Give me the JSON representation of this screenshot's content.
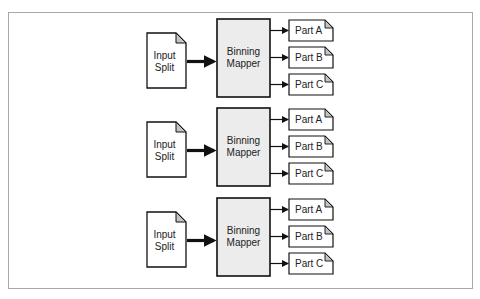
{
  "diagram": {
    "title": "",
    "groups": [
      {
        "input": {
          "line1": "Input",
          "line2": "Split"
        },
        "mapper": {
          "line1": "Binning",
          "line2": "Mapper"
        },
        "parts": [
          "Part A",
          "Part B",
          "Part C"
        ]
      },
      {
        "input": {
          "line1": "Input",
          "line2": "Split"
        },
        "mapper": {
          "line1": "Binning",
          "line2": "Mapper"
        },
        "parts": [
          "Part A",
          "Part B",
          "Part C"
        ]
      },
      {
        "input": {
          "line1": "Input",
          "line2": "Split"
        },
        "mapper": {
          "line1": "Binning",
          "line2": "Mapper"
        },
        "parts": [
          "Part A",
          "Part B",
          "Part C"
        ]
      }
    ],
    "colors": {
      "mapper_fill": "#ececec",
      "fold_fill": "#c4c4c4",
      "stroke": "#111111",
      "frame": "#a8a8a8"
    }
  }
}
